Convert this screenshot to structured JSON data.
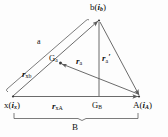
{
  "figure": {
    "type": "geometry-diagram",
    "background_color": "#fdfdfd",
    "line_color": "#5a5a5a",
    "text_color": "#111111"
  },
  "vertices": {
    "apex": {
      "symbol": "b",
      "vector": "i",
      "vector_sub": "b",
      "open_paren": "(",
      "close_paren": ")",
      "x": 99,
      "y": 19
    },
    "left": {
      "symbol": "x",
      "vector": "i",
      "vector_sub": "x",
      "open_paren": "(",
      "close_paren": ")",
      "x": 12,
      "y": 97
    },
    "right": {
      "symbol": "A",
      "vector": "i",
      "vector_sub": "A",
      "open_paren": "(",
      "close_paren": ")",
      "x": 140,
      "y": 97
    }
  },
  "points": {
    "Ga": {
      "symbol": "G",
      "sub": "a",
      "x": 58,
      "y": 62
    },
    "GB": {
      "symbol": "G",
      "sub": "B",
      "x": 99,
      "y": 97
    }
  },
  "labels": {
    "side_a": "a",
    "r_xb": {
      "symbol": "r",
      "sub": "xb"
    },
    "r_a": {
      "symbol": "r",
      "sub": "a"
    },
    "r_a_prime": {
      "symbol": "r",
      "sub": "a",
      "prime": "′"
    },
    "r_xA": {
      "symbol": "r",
      "sub": "xA"
    },
    "B": "B"
  }
}
